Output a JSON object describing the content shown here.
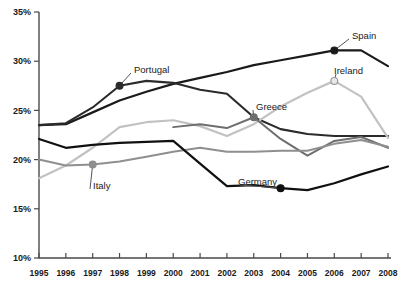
{
  "chart_data": {
    "type": "line",
    "title": "",
    "xlabel": "",
    "ylabel": "",
    "x": [
      1995,
      1996,
      1997,
      1998,
      1999,
      2000,
      2001,
      2002,
      2003,
      2004,
      2005,
      2006,
      2007,
      2008
    ],
    "xticklabels": [
      "1995",
      "1996",
      "1997",
      "1998",
      "1999",
      "2000",
      "2001",
      "2002",
      "2003",
      "2004",
      "2005",
      "2006",
      "2007",
      "2008"
    ],
    "yticklabels": [
      "10%",
      "15%",
      "20%",
      "25%",
      "30%",
      "35%"
    ],
    "ytickvalues": [
      10,
      15,
      20,
      25,
      30,
      35
    ],
    "ylim": [
      10,
      35
    ],
    "xlim": [
      1995,
      2008
    ],
    "grid": false,
    "legend": "inline-annotations",
    "series": [
      {
        "name": "Spain",
        "color": "#1a1a1a",
        "width": 2.2,
        "values": [
          23.5,
          23.6,
          24.8,
          26.0,
          26.9,
          27.7,
          28.3,
          28.9,
          29.6,
          30.1,
          30.6,
          31.1,
          31.1,
          29.5
        ],
        "marker": {
          "year": 2006,
          "value": 31.1,
          "style": "filled"
        },
        "label": "Spain",
        "label_x": 352,
        "label_y": 36
      },
      {
        "name": "Portugal",
        "color": "#2b2b2b",
        "width": 2.1,
        "values": [
          23.5,
          23.7,
          25.3,
          27.5,
          28.0,
          27.8,
          27.1,
          26.7,
          24.3,
          23.1,
          22.6,
          22.4,
          22.4,
          22.4
        ],
        "marker": {
          "year": 1998,
          "value": 27.5,
          "style": "filled"
        },
        "label": "Portugal",
        "label_x": 134,
        "label_y": 70
      },
      {
        "name": "Ireland",
        "color": "#c2c2c2",
        "width": 2.2,
        "values": [
          18.1,
          19.4,
          21.2,
          23.3,
          23.8,
          24.0,
          23.4,
          22.4,
          23.6,
          25.4,
          26.8,
          28.0,
          26.4,
          22.2
        ],
        "marker": {
          "year": 2006,
          "value": 28.0,
          "style": "hollow"
        },
        "label": "Ireland",
        "label_x": 334,
        "label_y": 71
      },
      {
        "name": "Greece",
        "color": "#6e6e6e",
        "width": 2.0,
        "values": [
          null,
          null,
          null,
          null,
          null,
          23.3,
          23.6,
          23.2,
          24.3,
          22.1,
          20.4,
          21.9,
          22.3,
          21.2
        ],
        "marker": {
          "year": 2003,
          "value": 24.3,
          "style": "filled"
        },
        "label": "Greece",
        "label_x": 256,
        "label_y": 107
      },
      {
        "name": "Italy",
        "color": "#8f8f8f",
        "width": 2.0,
        "values": [
          20.0,
          19.4,
          19.5,
          19.8,
          20.3,
          20.8,
          21.2,
          20.8,
          20.8,
          20.9,
          20.9,
          21.6,
          22.0,
          21.3
        ],
        "marker": {
          "year": 1997,
          "value": 19.5,
          "style": "filled"
        },
        "label": "Italy",
        "label_x": 93,
        "label_y": 186
      },
      {
        "name": "Germany",
        "color": "#101010",
        "width": 2.2,
        "values": [
          22.1,
          21.2,
          21.5,
          21.7,
          21.8,
          21.9,
          19.6,
          17.3,
          17.4,
          17.1,
          16.9,
          17.6,
          18.5,
          19.3
        ],
        "marker": {
          "year": 2004,
          "value": 17.1,
          "style": "filled"
        },
        "label": "Germany",
        "label_x": 238,
        "label_y": 182
      }
    ]
  }
}
